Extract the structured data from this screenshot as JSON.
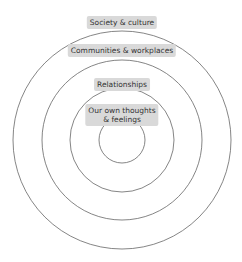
{
  "diagram": {
    "type": "concentric-circles",
    "ring_color": "#666666",
    "label_bg": "#d9d9d9",
    "rings": [
      {
        "id": "society",
        "label": "Society & culture"
      },
      {
        "id": "communities",
        "label": "Communities & workplaces"
      },
      {
        "id": "relationships",
        "label": "Relationships"
      },
      {
        "id": "self",
        "label": "Our own thoughts\n& feelings",
        "label_line1": "Our own thoughts",
        "label_line2": "& feelings"
      }
    ]
  }
}
